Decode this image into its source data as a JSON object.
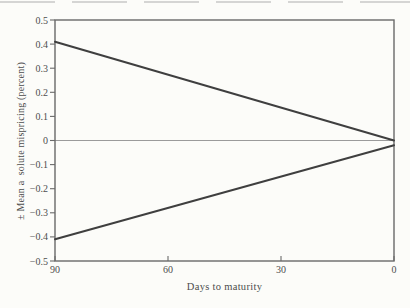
{
  "figure": {
    "background": "#fcfcf9",
    "axis_color": "#6a6a6a",
    "line_color": "#3f3f3f",
    "zero_line_color": "#9b9b9b",
    "text_color": "#4d4d4d",
    "artifact_color": "#b5b5b5"
  },
  "chart_data": {
    "type": "line",
    "x": [
      90,
      0
    ],
    "series": [
      {
        "name": "upper mispricing bound",
        "values": [
          0.41,
          0
        ]
      },
      {
        "name": "lower mispricing bound",
        "values": [
          -0.41,
          -0.02
        ]
      }
    ],
    "title": "",
    "xlabel": "Days to maturity",
    "ylabel": "± Mean a  solute mispricing (percent)",
    "xlim": [
      90,
      0
    ],
    "ylim": [
      -0.5,
      0.5
    ],
    "x_axis_reversed": true,
    "xticks": {
      "values": [
        90,
        60,
        30,
        0
      ],
      "labels": [
        "90",
        "60",
        "30",
        "0"
      ]
    },
    "yticks": {
      "values": [
        0.5,
        0.4,
        0.3,
        0.2,
        0.1,
        0,
        -0.1,
        -0.2,
        -0.3,
        -0.4,
        -0.5
      ],
      "labels": [
        "0.5",
        "0.4",
        "0.3",
        "0.2",
        "0.1",
        "0",
        "−0.1",
        "−0.2",
        "−0.3",
        "−0.4",
        "−0.5"
      ]
    },
    "grid": false,
    "legend": "none",
    "zero_line": true
  }
}
